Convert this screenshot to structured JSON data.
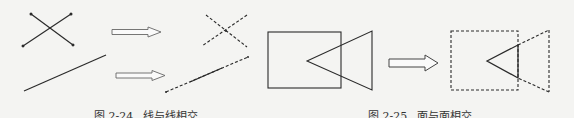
{
  "figures": [
    {
      "id": "fig-2-24",
      "number": "图 2-24",
      "title": "线与线相交"
    },
    {
      "id": "fig-2-25",
      "number": "图 2-25",
      "title": "面与面相交"
    }
  ],
  "colors": {
    "background": "#f4f4f2",
    "stroke": "#2a2a2a",
    "arrow_stroke": "#555555",
    "caption": "#333333"
  }
}
